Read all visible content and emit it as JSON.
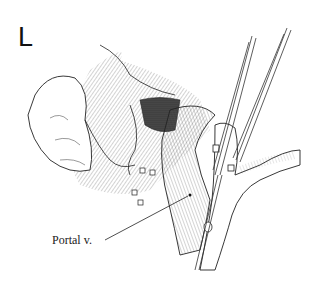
{
  "figure": {
    "panel_letter": "L",
    "labels": [
      {
        "text": "Portal v.",
        "target": "portal-vein"
      }
    ],
    "colors": {
      "ink": "#1a1a1a",
      "background": "#ffffff"
    }
  }
}
